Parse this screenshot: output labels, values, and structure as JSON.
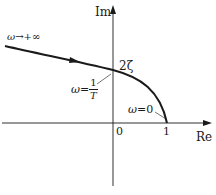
{
  "diagram": {
    "type": "nyquist-polar-plot",
    "axes": {
      "imag_label": "Im",
      "real_label": "Re",
      "origin_label": "0",
      "unit_tick_label": "1"
    },
    "annotations": {
      "omega_infinity": {
        "symbol": "ω",
        "arrow": "→",
        "value": "+∞"
      },
      "omega_zero": {
        "symbol": "ω",
        "eq": "=",
        "value": "0"
      },
      "omega_corner": {
        "symbol": "ω",
        "eq": "=",
        "numerator": "1",
        "denominator": "T"
      },
      "intercept": "2ζ"
    },
    "colors": {
      "line": "#1a1a1a",
      "background": "#ffffff"
    }
  }
}
